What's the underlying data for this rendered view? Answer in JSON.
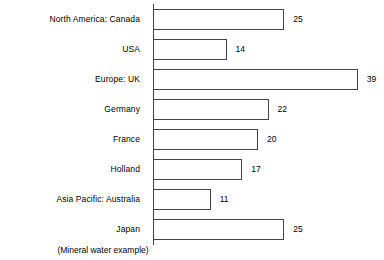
{
  "chart_data": {
    "type": "bar",
    "orientation": "horizontal",
    "title": "",
    "subtitle": "(Mineral water example)",
    "xlabel": "",
    "ylabel": "",
    "grid": false,
    "legend": false,
    "axis_line": true,
    "xlim": [
      0,
      39
    ],
    "categories": [
      "North America: Canada",
      "USA",
      "Europe: UK",
      "Germany",
      "France",
      "Holland",
      "Asia Pacific: Australia",
      "Japan"
    ],
    "values": [
      25,
      14,
      39,
      22,
      20,
      17,
      11,
      25
    ],
    "value_labels": [
      "25",
      "14",
      "39",
      "22",
      "20",
      "17",
      "11",
      "25"
    ],
    "bar_fill_color": "#ffffff",
    "bar_outline_color": "#444444",
    "axis_color": "#444444",
    "text_color": "#000000",
    "background_color": "#ffffff"
  }
}
